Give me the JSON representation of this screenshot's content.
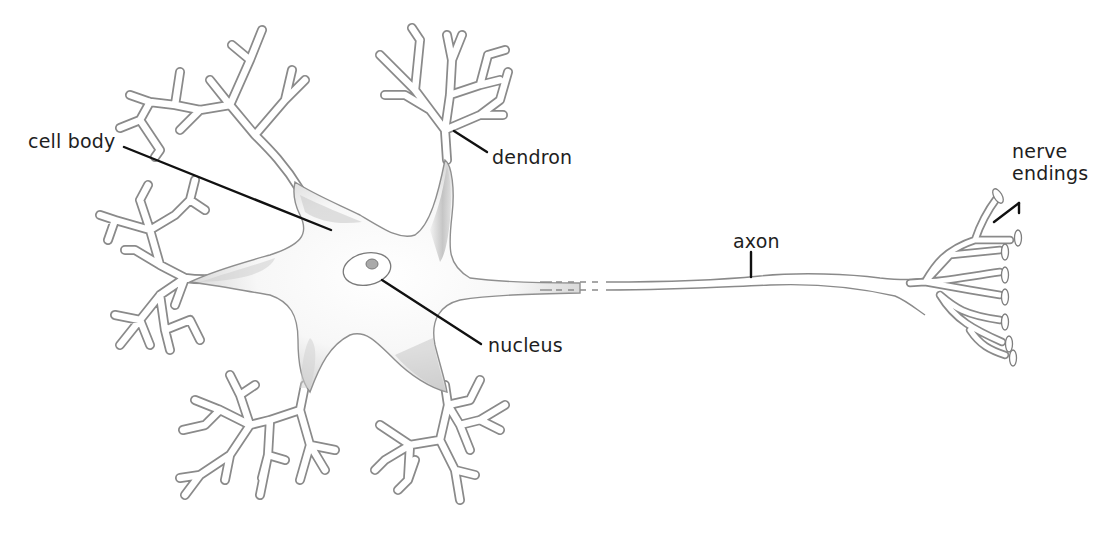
{
  "diagram": {
    "colors": {
      "background": "#ffffff",
      "outline": "#8a8a8a",
      "shade": "#b8b8b8",
      "leader": "#111111",
      "label_text": "#1e1e1e",
      "nucleolus": "#a9a9a9"
    },
    "labels": [
      {
        "id": "cell-body",
        "text": "cell body",
        "x": 28,
        "y": 130,
        "leader": {
          "x1": 124,
          "y1": 147,
          "x2": 331,
          "y2": 230
        }
      },
      {
        "id": "dendron",
        "text": "dendron",
        "x": 492,
        "y": 146,
        "leader": {
          "x1": 454,
          "y1": 131,
          "x2": 487,
          "y2": 152
        }
      },
      {
        "id": "axon",
        "text": "axon",
        "x": 733,
        "y": 232,
        "leader": {
          "x1": 751,
          "y1": 252,
          "x2": 751,
          "y2": 277
        }
      },
      {
        "id": "nucleus",
        "text": "nucleus",
        "x": 488,
        "y": 334,
        "leader": {
          "x1": 382,
          "y1": 280,
          "x2": 481,
          "y2": 344
        }
      },
      {
        "id": "nerve-endings",
        "lines": [
          "nerve",
          "endings"
        ],
        "x": 1012,
        "y": 140,
        "leader_a": {
          "x1": 1019,
          "y1": 203,
          "x2": 994,
          "y2": 222
        },
        "leader_b": {
          "x1": 1019,
          "y1": 203,
          "x2": 1019,
          "y2": 213
        }
      }
    ]
  }
}
